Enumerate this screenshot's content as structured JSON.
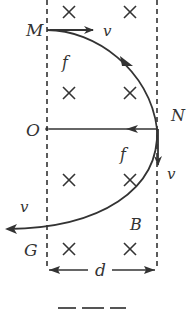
{
  "diagram": {
    "type": "physics-magnetic-field-trajectory",
    "field": {
      "label": "B",
      "direction": "into-page",
      "symbol": "×",
      "region_width_label": "d",
      "crosses": [
        {
          "x": 69,
          "y": 12
        },
        {
          "x": 130,
          "y": 12
        },
        {
          "x": 69,
          "y": 93
        },
        {
          "x": 130,
          "y": 93
        },
        {
          "x": 69,
          "y": 180
        },
        {
          "x": 130,
          "y": 180
        },
        {
          "x": 69,
          "y": 249
        },
        {
          "x": 130,
          "y": 249
        }
      ]
    },
    "points": {
      "M": {
        "label": "M",
        "x": 47,
        "y": 30
      },
      "N": {
        "label": "N",
        "x": 157,
        "y": 129
      },
      "O": {
        "label": "O",
        "x": 47,
        "y": 129
      },
      "G": {
        "label": "G",
        "x": 47,
        "y": 228
      }
    },
    "labels": {
      "M": "M",
      "N": "N",
      "O": "O",
      "G": "G",
      "B": "B",
      "d": "d",
      "v_at_M": "v",
      "v_at_N": "v",
      "v_at_G": "v",
      "f_near_M": "f",
      "f_at_N": "f"
    },
    "caption": ""
  }
}
